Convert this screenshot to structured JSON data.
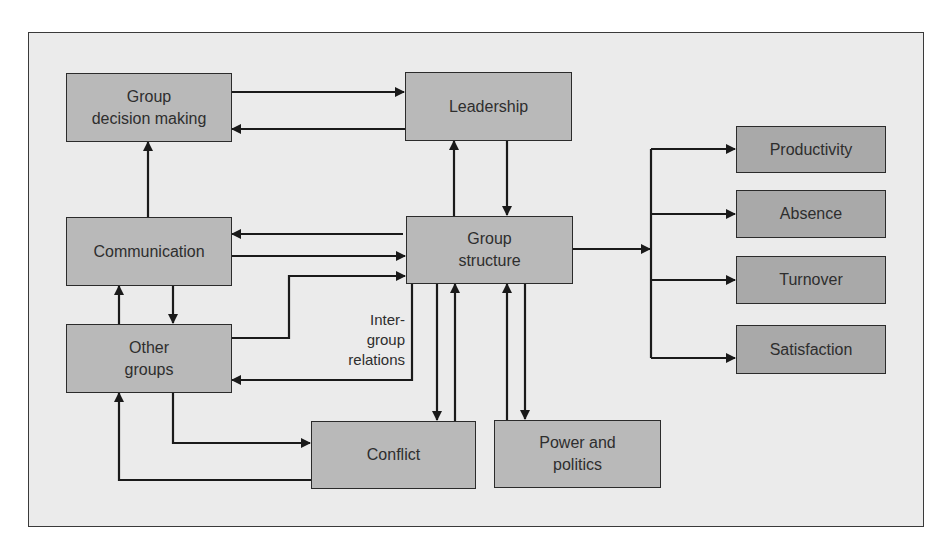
{
  "diagram": {
    "type": "flowchart",
    "colors": {
      "background": "#ebebeb",
      "box_fill": "#b9b9b9",
      "outcome_box_fill": "#a9a9a9",
      "line": "#1a1a1a",
      "text": "#2e2e2e"
    },
    "nodes": {
      "group_decision_making": "Group decision making",
      "leadership": "Leadership",
      "communication": "Communication",
      "group_structure": "Group structure",
      "other_groups": "Other groups",
      "conflict": "Conflict",
      "power_and_politics": "Power and politics",
      "productivity": "Productivity",
      "absence": "Absence",
      "turnover": "Turnover",
      "satisfaction": "Satisfaction"
    },
    "node_lines": {
      "group_decision_making": [
        "Group",
        "decision making"
      ],
      "group_structure": [
        "Group",
        "structure"
      ],
      "other_groups": [
        "Other",
        "groups"
      ],
      "power_and_politics": [
        "Power and",
        "politics"
      ]
    },
    "edge_labels": {
      "intergroup_relations": [
        "Inter-",
        "group",
        "relations"
      ]
    },
    "edges": [
      {
        "from": "Group decision making",
        "to": "Leadership"
      },
      {
        "from": "Leadership",
        "to": "Group decision making"
      },
      {
        "from": "Communication",
        "to": "Group decision making"
      },
      {
        "from": "Group structure",
        "to": "Leadership"
      },
      {
        "from": "Leadership",
        "to": "Group structure"
      },
      {
        "from": "Group structure",
        "to": "Communication"
      },
      {
        "from": "Communication",
        "to": "Group structure"
      },
      {
        "from": "Other groups",
        "to": "Group structure"
      },
      {
        "from": "Group structure",
        "to": "Other groups",
        "label": "Inter-group relations"
      },
      {
        "from": "Other groups",
        "to": "Communication"
      },
      {
        "from": "Communication",
        "to": "Other groups"
      },
      {
        "from": "Other groups",
        "to": "Conflict"
      },
      {
        "from": "Conflict",
        "to": "Other groups"
      },
      {
        "from": "Group structure",
        "to": "Conflict"
      },
      {
        "from": "Conflict",
        "to": "Group structure"
      },
      {
        "from": "Power and politics",
        "to": "Group structure"
      },
      {
        "from": "Group structure",
        "to": "Power and politics"
      },
      {
        "from": "Group structure",
        "to": "Productivity"
      },
      {
        "from": "Group structure",
        "to": "Absence"
      },
      {
        "from": "Group structure",
        "to": "Turnover"
      },
      {
        "from": "Group structure",
        "to": "Satisfaction"
      }
    ]
  }
}
